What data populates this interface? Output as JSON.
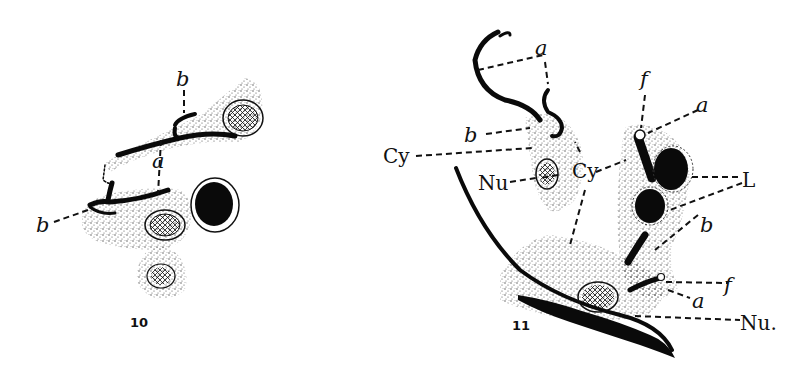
{
  "figure_10": {
    "number": "10",
    "labels": {
      "b_top": "b",
      "a": "a",
      "b_left": "b"
    }
  },
  "figure_11": {
    "number": "11",
    "labels": {
      "a_top": "a",
      "b_left": "b",
      "cy_left": "Cy",
      "nu_left": "Nu",
      "cy_center": "Cy",
      "f_top": "f",
      "a_right_top": "a",
      "L": "L",
      "b_right": "b",
      "f_right": "f",
      "a_right_bottom": "a",
      "nu_bottom": "Nu."
    }
  },
  "colors": {
    "ink": "#0a0a0a",
    "paper": "#ffffff"
  }
}
